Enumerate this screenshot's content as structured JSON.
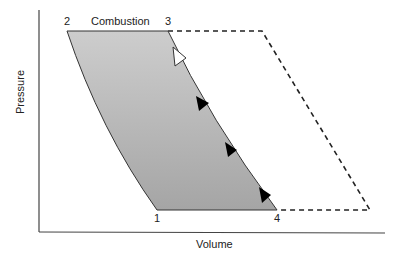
{
  "diagram": {
    "type": "pv-diagram",
    "axes": {
      "y_label": "Pressure",
      "x_label": "Volume"
    },
    "points": [
      {
        "id": "1",
        "label": "1",
        "x": 157,
        "y": 210
      },
      {
        "id": "2",
        "label": "2",
        "x": 67,
        "y": 31
      },
      {
        "id": "3",
        "label": "3",
        "x": 168,
        "y": 31
      },
      {
        "id": "4",
        "label": "4",
        "x": 277,
        "y": 210
      }
    ],
    "process_labels": {
      "combustion": "Combustion"
    },
    "dashed_outline": [
      [
        168,
        31
      ],
      [
        262,
        31
      ],
      [
        370,
        210
      ],
      [
        277,
        210
      ]
    ],
    "colors": {
      "fill_top": "#c9c9c9",
      "fill_bottom": "#a8a8a8",
      "stroke": "#333333",
      "arrow_solid": "#000000",
      "arrow_open": "#ffffff"
    }
  }
}
